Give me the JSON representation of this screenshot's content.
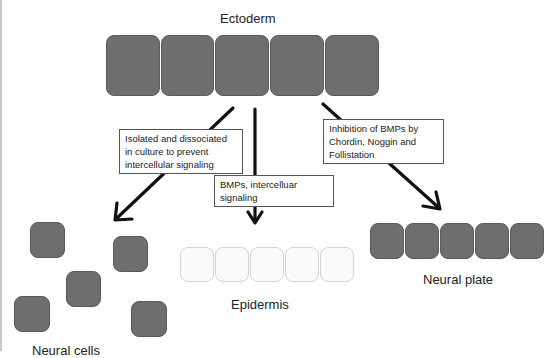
{
  "diagram": {
    "top_label": "Ectoderm",
    "ectoderm_cells": 5,
    "arrows": [
      {
        "id": "left",
        "label": "Isolated and dissociated in culture to prevent intercellular signaling",
        "label_lines": [
          "Isolated and dissociated",
          "in culture to prevent",
          "intercellular signaling"
        ]
      },
      {
        "id": "center",
        "label": "BMPs, intercelluar signaling",
        "label_lines": [
          "BMPs, intercelluar signaling"
        ]
      },
      {
        "id": "right",
        "label": "Inhibition of BMPs by Chordin, Noggin and Follistation",
        "label_lines": [
          "Inhibition of BMPs by",
          "Chordin, Noggin and",
          "Follistation"
        ]
      }
    ],
    "outcomes": {
      "left": {
        "label": "Neural cells",
        "cells": 5,
        "arrangement": "scattered"
      },
      "center": {
        "label": "Epidermis",
        "cells": 5,
        "arrangement": "row"
      },
      "right": {
        "label": "Neural plate",
        "cells": 5,
        "arrangement": "row"
      }
    },
    "colors": {
      "dark_cell": "#6e6e6e",
      "light_cell": "#fafafa",
      "arrow": "#111111"
    }
  }
}
